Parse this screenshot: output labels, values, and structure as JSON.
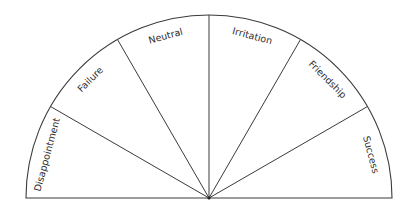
{
  "diagram": {
    "type": "semicircle-sector-chart",
    "center": {
      "x": 209,
      "y": 198
    },
    "radius": 183,
    "line_color": "#3a3a3a",
    "text_color": "#2e2e2e",
    "sectors": [
      {
        "label": "Disappointment",
        "start_deg": 180,
        "end_deg": 150
      },
      {
        "label": "Failure",
        "start_deg": 150,
        "end_deg": 120
      },
      {
        "label": "Neutral",
        "start_deg": 120,
        "end_deg": 90
      },
      {
        "label": "Irritation",
        "start_deg": 90,
        "end_deg": 60
      },
      {
        "label": "Friendship",
        "start_deg": 60,
        "end_deg": 30
      },
      {
        "label": "Success",
        "start_deg": 30,
        "end_deg": 0
      }
    ]
  }
}
